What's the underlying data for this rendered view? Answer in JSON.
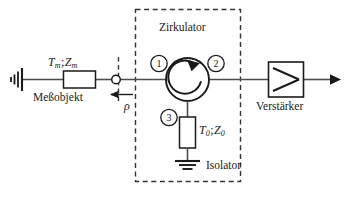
{
  "figure": {
    "labels": {
      "circulator": "Zirkulator",
      "isolator": "Isolator",
      "amplifier": "Verstärker",
      "dut": "Meßobjekt"
    },
    "math": {
      "dut_params_T": "T",
      "dut_params_T_sub": "m",
      "dut_params_sep": ";",
      "dut_params_Z": "Z",
      "dut_params_Z_sub": "m",
      "load_params_T": "T",
      "load_params_T_sub": "0",
      "load_params_sep": ";",
      "load_params_Z": "Z",
      "load_params_Z_sub": "0",
      "reflection": "ρ"
    },
    "ports": {
      "port1": "1",
      "port2": "2",
      "port3": "3"
    },
    "icons": {
      "ground_left": "ground-icon",
      "ground_bottom": "ground-icon",
      "resistor_dut": "resistor-icon",
      "resistor_load": "resistor-icon",
      "circulator_arrow": "circular-arrow-icon",
      "amplifier_triangle": "amplifier-triangle-icon",
      "output_arrow": "arrow-right-icon",
      "reflection_arrow": "arrow-left-icon",
      "node_connector": "open-node-icon"
    },
    "colors": {
      "line": "#4d4d4d",
      "stroke": "#1a1a1a",
      "dashed": "#333333",
      "background": "#ffffff"
    },
    "caption": ""
  }
}
